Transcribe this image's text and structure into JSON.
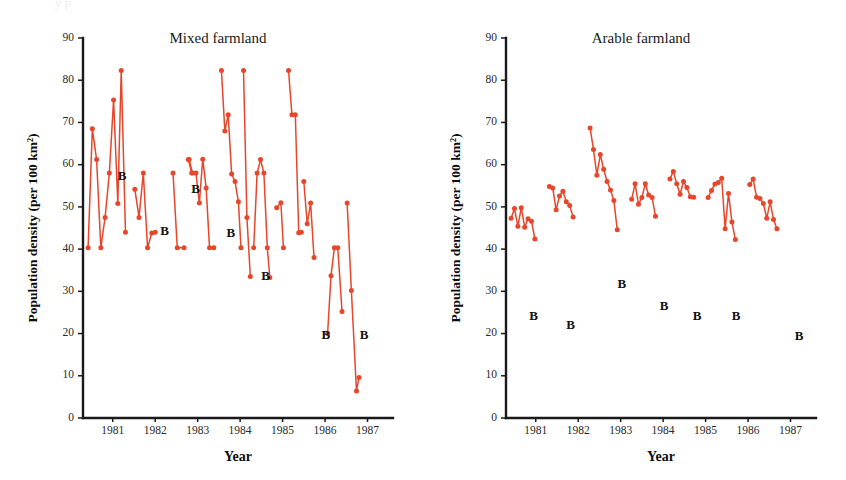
{
  "figure": {
    "background_color": "#ffffff",
    "series_color": "#E8462A",
    "axis_color": "#1a1a1a",
    "text_color": "#1a1a1a",
    "top_crop_artifact": "y p"
  },
  "chart_data": [
    {
      "type": "line",
      "panel": "left",
      "title": "Mixed farmland",
      "xlabel": "Year",
      "ylabel": "Population density (per 100 km²)",
      "ylim": [
        0,
        90
      ],
      "yticks": [
        0,
        10,
        20,
        30,
        40,
        50,
        60,
        70,
        80,
        90
      ],
      "ytick_labels": [
        "0",
        "10",
        "20",
        "30",
        "40",
        "50",
        "60",
        "70",
        "80",
        "90"
      ],
      "xlim": [
        1980.3,
        1987.6
      ],
      "xticks": [
        1981,
        1982,
        1983,
        1984,
        1985,
        1986,
        1987
      ],
      "xtick_labels": [
        "1981",
        "1982",
        "1983",
        "1984",
        "1985",
        "1986",
        "1987"
      ],
      "grid": false,
      "legend": false,
      "marker": "filled-circle",
      "annotations": [
        {
          "text": "B",
          "x": 1981.22,
          "y": 57.0
        },
        {
          "text": "B",
          "x": 1982.22,
          "y": 44.0
        },
        {
          "text": "B",
          "x": 1982.95,
          "y": 54.0
        },
        {
          "text": "B",
          "x": 1983.78,
          "y": 43.5
        },
        {
          "text": "B",
          "x": 1984.6,
          "y": 33.5
        },
        {
          "text": "B",
          "x": 1986.02,
          "y": 19.5
        },
        {
          "text": "B",
          "x": 1986.92,
          "y": 19.5
        }
      ],
      "segments": [
        {
          "name": "segment-1",
          "points": [
            {
              "x": 1980.42,
              "y": 40.3
            },
            {
              "x": 1980.52,
              "y": 68.5
            },
            {
              "x": 1980.62,
              "y": 61.2
            },
            {
              "x": 1980.72,
              "y": 40.3
            },
            {
              "x": 1980.82,
              "y": 47.5
            },
            {
              "x": 1980.92,
              "y": 58.0
            },
            {
              "x": 1981.02,
              "y": 75.3
            },
            {
              "x": 1981.12,
              "y": 50.8
            },
            {
              "x": 1981.2,
              "y": 82.3
            },
            {
              "x": 1981.3,
              "y": 44.0
            }
          ]
        },
        {
          "name": "segment-2",
          "points": [
            {
              "x": 1981.52,
              "y": 54.2
            },
            {
              "x": 1981.62,
              "y": 47.5
            },
            {
              "x": 1981.72,
              "y": 58.0
            },
            {
              "x": 1981.82,
              "y": 40.3
            },
            {
              "x": 1981.92,
              "y": 43.8
            },
            {
              "x": 1982.0,
              "y": 44.0
            }
          ]
        },
        {
          "name": "segment-3",
          "points": [
            {
              "x": 1982.42,
              "y": 58.0
            },
            {
              "x": 1982.52,
              "y": 40.3
            },
            {
              "x": 1982.68,
              "y": 40.3
            }
          ]
        },
        {
          "name": "segment-4",
          "points": [
            {
              "x": 1982.78,
              "y": 61.2
            },
            {
              "x": 1982.86,
              "y": 58.0
            },
            {
              "x": 1882.94,
              "y": 58.0
            }
          ]
        },
        {
          "name": "segment-5",
          "points": [
            {
              "x": 1982.8,
              "y": 61.2
            },
            {
              "x": 1982.88,
              "y": 58.0
            },
            {
              "x": 1982.96,
              "y": 58.0
            },
            {
              "x": 1983.04,
              "y": 50.9
            },
            {
              "x": 1983.12,
              "y": 61.3
            },
            {
              "x": 1983.2,
              "y": 54.5
            },
            {
              "x": 1983.28,
              "y": 40.3
            },
            {
              "x": 1983.38,
              "y": 40.3
            }
          ]
        },
        {
          "name": "segment-6",
          "points": [
            {
              "x": 1983.56,
              "y": 82.3
            },
            {
              "x": 1983.64,
              "y": 68.0
            },
            {
              "x": 1983.72,
              "y": 71.8
            },
            {
              "x": 1983.8,
              "y": 57.8
            },
            {
              "x": 1983.88,
              "y": 56.0
            },
            {
              "x": 1983.96,
              "y": 51.2
            },
            {
              "x": 1984.02,
              "y": 40.3
            }
          ]
        },
        {
          "name": "segment-7",
          "points": [
            {
              "x": 1984.08,
              "y": 82.3
            },
            {
              "x": 1984.16,
              "y": 47.5
            },
            {
              "x": 1984.24,
              "y": 33.5
            }
          ]
        },
        {
          "name": "segment-8",
          "points": [
            {
              "x": 1984.32,
              "y": 40.3
            },
            {
              "x": 1984.4,
              "y": 58.0
            },
            {
              "x": 1984.48,
              "y": 61.2
            },
            {
              "x": 1984.56,
              "y": 58.0
            },
            {
              "x": 1984.64,
              "y": 40.3
            },
            {
              "x": 1984.7,
              "y": 33.3
            }
          ]
        },
        {
          "name": "segment-9",
          "points": [
            {
              "x": 1984.86,
              "y": 49.8
            },
            {
              "x": 1984.96,
              "y": 51.0
            },
            {
              "x": 1985.02,
              "y": 40.3
            }
          ]
        },
        {
          "name": "segment-10",
          "points": [
            {
              "x": 1985.14,
              "y": 82.3
            },
            {
              "x": 1985.22,
              "y": 71.8
            },
            {
              "x": 1985.3,
              "y": 71.8
            },
            {
              "x": 1985.38,
              "y": 43.9
            },
            {
              "x": 1985.44,
              "y": 44.0
            }
          ]
        },
        {
          "name": "segment-11",
          "points": [
            {
              "x": 1985.5,
              "y": 56.0
            },
            {
              "x": 1985.58,
              "y": 46.0
            },
            {
              "x": 1985.66,
              "y": 50.9
            },
            {
              "x": 1985.74,
              "y": 38.0
            }
          ]
        },
        {
          "name": "segment-12",
          "points": [
            {
              "x": 1986.06,
              "y": 20.0
            },
            {
              "x": 1986.14,
              "y": 33.7
            },
            {
              "x": 1986.22,
              "y": 40.3
            },
            {
              "x": 1986.3,
              "y": 40.3
            },
            {
              "x": 1986.4,
              "y": 25.2
            }
          ]
        },
        {
          "name": "segment-13",
          "points": [
            {
              "x": 1986.52,
              "y": 50.9
            },
            {
              "x": 1986.62,
              "y": 30.2
            },
            {
              "x": 1986.74,
              "y": 6.4
            },
            {
              "x": 1986.8,
              "y": 9.6
            }
          ]
        }
      ]
    },
    {
      "type": "line",
      "panel": "right",
      "title": "Arable farmland",
      "xlabel": "Year",
      "ylabel": "Population density (per 100 km²)",
      "ylim": [
        0,
        90
      ],
      "yticks": [
        0,
        10,
        20,
        30,
        40,
        50,
        60,
        70,
        80,
        90
      ],
      "ytick_labels": [
        "0",
        "10",
        "20",
        "30",
        "40",
        "50",
        "60",
        "70",
        "80",
        "90"
      ],
      "xlim": [
        1980.3,
        1987.6
      ],
      "xticks": [
        1981,
        1982,
        1983,
        1984,
        1985,
        1986,
        1987
      ],
      "xtick_labels": [
        "1981",
        "1982",
        "1983",
        "1984",
        "1985",
        "1986",
        "1987"
      ],
      "grid": false,
      "legend": false,
      "marker": "filled-circle",
      "annotations": [
        {
          "text": "B",
          "x": 1980.95,
          "y": 23.8
        },
        {
          "text": "B",
          "x": 1981.82,
          "y": 21.8
        },
        {
          "text": "B",
          "x": 1983.03,
          "y": 31.5
        },
        {
          "text": "B",
          "x": 1984.02,
          "y": 26.2
        },
        {
          "text": "B",
          "x": 1984.8,
          "y": 23.8
        },
        {
          "text": "B",
          "x": 1985.72,
          "y": 23.8
        },
        {
          "text": "B",
          "x": 1987.2,
          "y": 19.2
        }
      ],
      "segments": [
        {
          "name": "segment-1",
          "points": [
            {
              "x": 1980.42,
              "y": 47.3
            },
            {
              "x": 1980.5,
              "y": 49.6
            },
            {
              "x": 1980.58,
              "y": 45.4
            },
            {
              "x": 1980.66,
              "y": 49.8
            },
            {
              "x": 1980.74,
              "y": 45.2
            },
            {
              "x": 1980.82,
              "y": 47.2
            },
            {
              "x": 1980.9,
              "y": 46.6
            },
            {
              "x": 1980.98,
              "y": 42.4
            }
          ]
        },
        {
          "name": "segment-2",
          "points": [
            {
              "x": 1981.32,
              "y": 54.8
            },
            {
              "x": 1981.4,
              "y": 54.5
            },
            {
              "x": 1981.48,
              "y": 49.3
            },
            {
              "x": 1981.56,
              "y": 52.6
            },
            {
              "x": 1981.64,
              "y": 53.7
            },
            {
              "x": 1981.72,
              "y": 51.2
            },
            {
              "x": 1981.8,
              "y": 50.3
            },
            {
              "x": 1981.88,
              "y": 47.6
            }
          ]
        },
        {
          "name": "segment-3",
          "points": [
            {
              "x": 1982.28,
              "y": 68.7
            },
            {
              "x": 1982.36,
              "y": 63.6
            },
            {
              "x": 1982.44,
              "y": 57.5
            },
            {
              "x": 1982.52,
              "y": 62.4
            },
            {
              "x": 1982.6,
              "y": 58.9
            },
            {
              "x": 1982.68,
              "y": 56.0
            },
            {
              "x": 1982.76,
              "y": 54.0
            },
            {
              "x": 1982.84,
              "y": 51.5
            },
            {
              "x": 1982.92,
              "y": 44.6
            }
          ]
        },
        {
          "name": "segment-4",
          "points": [
            {
              "x": 1983.26,
              "y": 51.8
            },
            {
              "x": 1983.34,
              "y": 55.5
            },
            {
              "x": 1983.42,
              "y": 50.6
            },
            {
              "x": 1983.5,
              "y": 52.2
            },
            {
              "x": 1983.58,
              "y": 55.5
            },
            {
              "x": 1983.66,
              "y": 52.8
            },
            {
              "x": 1983.74,
              "y": 52.2
            },
            {
              "x": 1983.82,
              "y": 47.8
            }
          ]
        },
        {
          "name": "segment-5",
          "points": [
            {
              "x": 1984.16,
              "y": 56.6
            },
            {
              "x": 1984.24,
              "y": 58.4
            },
            {
              "x": 1984.32,
              "y": 55.5
            },
            {
              "x": 1984.4,
              "y": 53.0
            },
            {
              "x": 1984.48,
              "y": 56.0
            },
            {
              "x": 1984.56,
              "y": 54.6
            },
            {
              "x": 1984.64,
              "y": 52.4
            },
            {
              "x": 1984.72,
              "y": 52.3
            }
          ]
        },
        {
          "name": "segment-6",
          "points": [
            {
              "x": 1985.06,
              "y": 52.2
            },
            {
              "x": 1985.14,
              "y": 53.9
            },
            {
              "x": 1985.22,
              "y": 55.4
            },
            {
              "x": 1985.3,
              "y": 55.8
            },
            {
              "x": 1985.38,
              "y": 56.8
            },
            {
              "x": 1985.46,
              "y": 44.8
            },
            {
              "x": 1985.54,
              "y": 53.2
            },
            {
              "x": 1985.62,
              "y": 46.4
            },
            {
              "x": 1985.7,
              "y": 42.3
            }
          ]
        },
        {
          "name": "segment-7",
          "points": [
            {
              "x": 1986.04,
              "y": 55.3
            },
            {
              "x": 1986.12,
              "y": 56.6
            },
            {
              "x": 1986.2,
              "y": 52.3
            },
            {
              "x": 1986.28,
              "y": 52.0
            },
            {
              "x": 1986.36,
              "y": 50.8
            },
            {
              "x": 1986.44,
              "y": 47.3
            },
            {
              "x": 1986.52,
              "y": 51.2
            },
            {
              "x": 1986.6,
              "y": 47.0
            },
            {
              "x": 1986.68,
              "y": 44.8
            }
          ]
        }
      ]
    }
  ]
}
